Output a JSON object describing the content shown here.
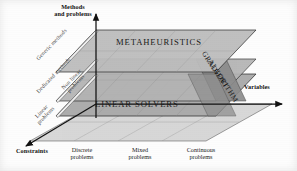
{
  "figure": {
    "type": "3d-conceptual-diagram"
  },
  "axes": {
    "vertical": {
      "label_line1": "Methods",
      "label_line2": "and problems",
      "name": "Methods and problems"
    },
    "right": {
      "label": "Variables"
    },
    "left": {
      "label": "Constraints"
    }
  },
  "ticks": {
    "x_axis": [
      {
        "line1": "Discrete",
        "line2": "problems"
      },
      {
        "line1": "Mixed",
        "line2": "problems"
      },
      {
        "line1": "Continuous",
        "line2": "problems"
      }
    ]
  },
  "planes": [
    {
      "id": "metaheuristics",
      "label": "METAHEURISTICS",
      "level": "top",
      "fill": "#b9b9b9"
    },
    {
      "id": "dedicated",
      "label": "",
      "level": "middle",
      "fill": "#b0b0b0"
    },
    {
      "id": "linear-solvers",
      "label": "LINEAR SOLVERS",
      "level": "lower",
      "fill": "#a6a6a6"
    },
    {
      "id": "base",
      "label": "",
      "level": "base",
      "fill": "#d7d7d7"
    }
  ],
  "diagonal_labels": [
    {
      "id": "generic-methods",
      "text": "Generic methods"
    },
    {
      "id": "dedicated-methods",
      "text": "Dedicated methods"
    },
    {
      "id": "non-linear-problems",
      "line1": "Non linear",
      "line2": "problems"
    },
    {
      "id": "linear-problems",
      "line1": "Linear",
      "line2": "problems"
    }
  ],
  "band": {
    "id": "gradient-algorithm",
    "line1": "GRADIENT",
    "line2": "ALGORITHM",
    "fill": "#8d8d8d"
  },
  "colors": {
    "stroke": "#222222",
    "grid": "#8f8f8f",
    "plane_top": "#b9b9b9",
    "plane_mid": "#b0b0b0",
    "plane_low": "#a6a6a6",
    "plane_base": "#d7d7d7",
    "band": "#8d8d8d",
    "text": "#111111"
  }
}
